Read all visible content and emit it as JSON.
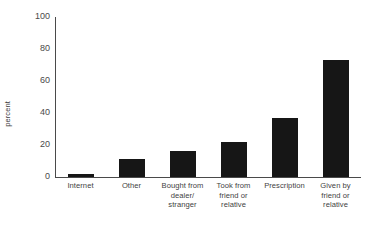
{
  "chart_data": {
    "type": "bar",
    "title": "",
    "subtitle": "",
    "xlabel": "",
    "ylabel": "percent",
    "ylim": [
      0,
      100
    ],
    "yticks": [
      0,
      20,
      40,
      60,
      80,
      100
    ],
    "grid": false,
    "legend": null,
    "bar_color": "#161616",
    "axis_color": "#4a4a4a",
    "categories": [
      "Internet",
      "Other",
      "Bought from dealer/ stranger",
      "Took from friend or relative",
      "Prescription",
      "Given by friend or relative"
    ],
    "category_lines": [
      [
        "Internet"
      ],
      [
        "Other"
      ],
      [
        "Bought from",
        "dealer/",
        "stranger"
      ],
      [
        "Took from",
        "friend or",
        "relative"
      ],
      [
        "Prescription"
      ],
      [
        "Given by",
        "friend or",
        "relative"
      ]
    ],
    "values": [
      2,
      11,
      16,
      22,
      37,
      73
    ]
  }
}
